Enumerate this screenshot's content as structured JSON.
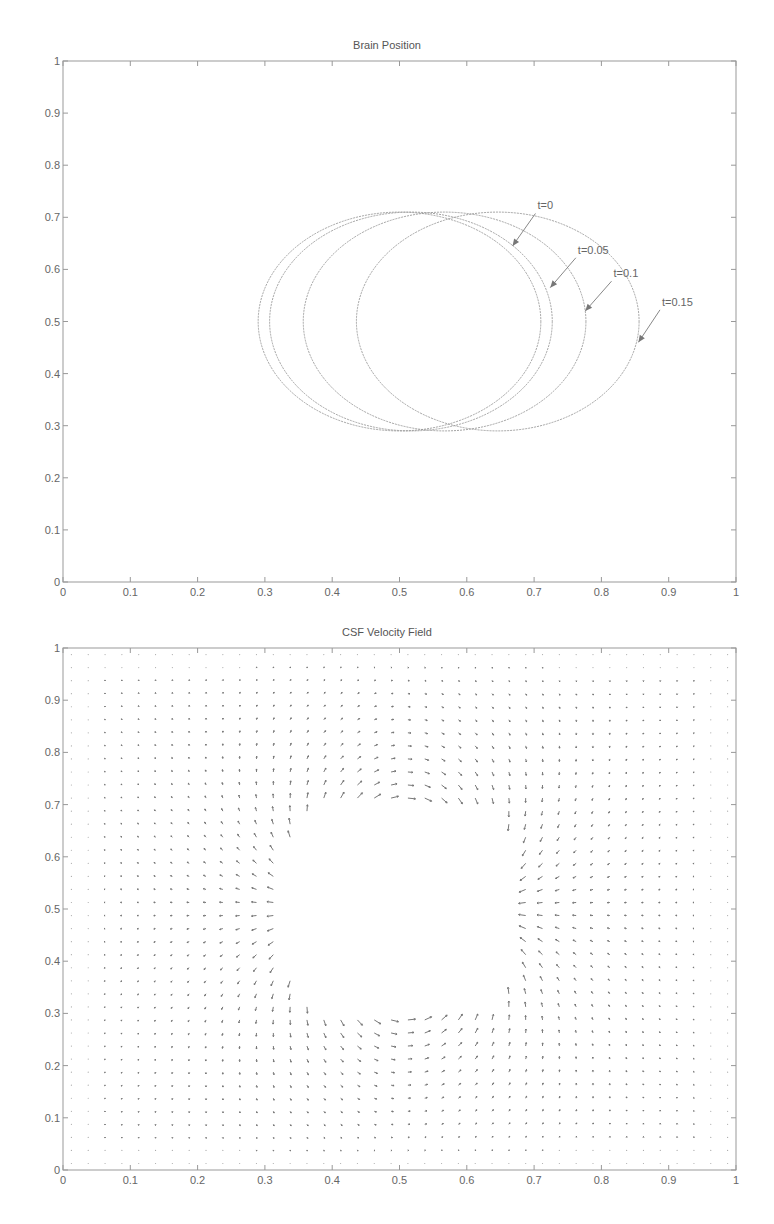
{
  "chart_data": [
    {
      "type": "line",
      "title": "Brain Position",
      "xlabel": "",
      "ylabel": "",
      "xlim": [
        0,
        1
      ],
      "ylim": [
        0,
        1
      ],
      "xticks": [
        "0",
        "0.1",
        "0.2",
        "0.3",
        "0.4",
        "0.5",
        "0.6",
        "0.7",
        "0.8",
        "0.9",
        "1"
      ],
      "yticks": [
        "0",
        "0.1",
        "0.2",
        "0.3",
        "0.4",
        "0.5",
        "0.6",
        "0.7",
        "0.8",
        "0.9",
        "1"
      ],
      "grid": false,
      "series": [
        {
          "name": "t=0",
          "shape": "ellipse",
          "cx": 0.5,
          "cy": 0.5,
          "rx": 0.21,
          "ry": 0.21
        },
        {
          "name": "t=0.05",
          "shape": "ellipse",
          "cx": 0.517,
          "cy": 0.5,
          "rx": 0.21,
          "ry": 0.21
        },
        {
          "name": "t=0.1",
          "shape": "ellipse",
          "cx": 0.567,
          "cy": 0.5,
          "rx": 0.21,
          "ry": 0.21
        },
        {
          "name": "t=0.15",
          "shape": "ellipse",
          "cx": 0.646,
          "cy": 0.5,
          "rx": 0.21,
          "ry": 0.21
        }
      ],
      "annotations": [
        {
          "text": "t=0",
          "text_x": 0.705,
          "text_y": 0.715,
          "arrow_to_x": 0.668,
          "arrow_to_y": 0.645
        },
        {
          "text": "t=0.05",
          "text_x": 0.765,
          "text_y": 0.63,
          "arrow_to_x": 0.724,
          "arrow_to_y": 0.565
        },
        {
          "text": "t=0.1",
          "text_x": 0.818,
          "text_y": 0.585,
          "arrow_to_x": 0.776,
          "arrow_to_y": 0.52
        },
        {
          "text": "t=0.15",
          "text_x": 0.89,
          "text_y": 0.53,
          "arrow_to_x": 0.855,
          "arrow_to_y": 0.46
        }
      ]
    },
    {
      "type": "quiver",
      "title": "CSF Velocity Field",
      "xlabel": "",
      "ylabel": "",
      "xlim": [
        0,
        1
      ],
      "ylim": [
        0,
        1
      ],
      "xticks": [
        "0",
        "0.1",
        "0.2",
        "0.3",
        "0.4",
        "0.5",
        "0.6",
        "0.7",
        "0.8",
        "0.9",
        "1"
      ],
      "yticks": [
        "0",
        "0.1",
        "0.2",
        "0.3",
        "0.4",
        "0.5",
        "0.6",
        "0.7",
        "0.8",
        "0.9",
        "1"
      ],
      "grid_spacing": 0.025,
      "grid_points_per_axis": 40,
      "obstacle": {
        "shape": "rounded-rect",
        "x0": 0.33,
        "x1": 0.68,
        "y0": 0.29,
        "y1": 0.71
      },
      "flow_description": "Flow around moving brain: leftward flow above (y~0.71-0.9) and below (y~0.1-0.29) the brain, outward from right side, converging toward left side; max speed near obstacle top/bottom edges",
      "peak_speed_regions": [
        {
          "x_range": [
            0.4,
            0.58
          ],
          "y": 0.72,
          "direction": "left"
        },
        {
          "x_range": [
            0.4,
            0.58
          ],
          "y": 0.28,
          "direction": "left"
        }
      ]
    }
  ]
}
